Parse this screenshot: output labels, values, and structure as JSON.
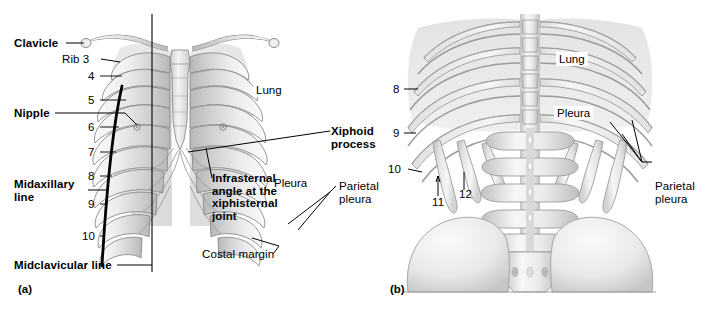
{
  "figure": {
    "panels": [
      {
        "id": "a",
        "mark": "(a)",
        "view": "anterior",
        "labels": {
          "clavicle": "Clavicle",
          "rib3": "Rib 3",
          "nipple": "Nipple",
          "midaxillary": "Midaxillary\nline",
          "midclavicular": "Midclavicular line",
          "lung": "Lung",
          "pleura": "Pleura",
          "xiphoid": "Xiphoid\nprocess",
          "infrasternal": "Infrasternal\nangle at the\nxiphisternal\njoint",
          "costal_margin": "Costal margin",
          "parietal_pleura": "Parietal\npleura"
        },
        "rib_numbers": [
          "4",
          "5",
          "6",
          "7",
          "8",
          "9",
          "10"
        ]
      },
      {
        "id": "b",
        "mark": "(b)",
        "view": "posterior",
        "labels": {
          "lung": "Lung",
          "pleura": "Pleura",
          "parietal_pleura": "Parietal\npleura"
        },
        "rib_numbers": [
          "8",
          "9",
          "10",
          "11",
          "12"
        ]
      }
    ],
    "colors": {
      "background": "#ffffff",
      "ink": "#000000",
      "bone_light": "#f2f2f2",
      "bone_mid": "#d8d8d8",
      "bone_dark": "#9f9f9f",
      "outline": "#8a8a8a",
      "lung_tint": "#e6e6e6"
    }
  }
}
